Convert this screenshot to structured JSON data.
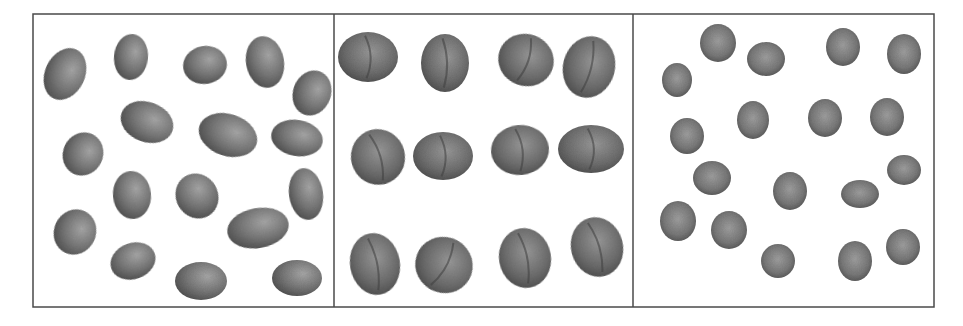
{
  "figure": {
    "frame": {
      "x": 33,
      "y": 14,
      "width": 901,
      "height": 293,
      "stroke": "#4a4a4a"
    },
    "dividers": [
      334,
      633
    ],
    "colors": {
      "seed_dark": "#4f4f4f",
      "seed_mid": "#7a7a7a",
      "seed_light": "#a8a8a8",
      "background": "#ffffff"
    },
    "panels": [
      {
        "name": "elongated-seeds-panel",
        "kind": "elongated-seed",
        "count": 17,
        "items": [
          [
            65,
            74,
            20,
            27,
            25
          ],
          [
            131,
            57,
            17,
            23,
            5
          ],
          [
            205,
            65,
            22,
            19,
            -10
          ],
          [
            265,
            62,
            19,
            26,
            -10
          ],
          [
            312,
            93,
            19,
            23,
            20
          ],
          [
            147,
            122,
            27,
            20,
            20
          ],
          [
            228,
            135,
            30,
            21,
            18
          ],
          [
            297,
            138,
            26,
            18,
            10
          ],
          [
            83,
            154,
            20,
            22,
            25
          ],
          [
            132,
            195,
            19,
            24,
            -5
          ],
          [
            197,
            196,
            21,
            23,
            -30
          ],
          [
            306,
            194,
            17,
            26,
            -8
          ],
          [
            75,
            232,
            21,
            23,
            25
          ],
          [
            258,
            228,
            31,
            20,
            -10
          ],
          [
            133,
            261,
            23,
            18,
            -20
          ],
          [
            201,
            281,
            26,
            19,
            0
          ],
          [
            297,
            278,
            25,
            18,
            0
          ]
        ]
      },
      {
        "name": "walnut-panel",
        "kind": "walnut",
        "count": 12,
        "items": [
          [
            368,
            57,
            30,
            25,
            0
          ],
          [
            445,
            63,
            24,
            29,
            0
          ],
          [
            526,
            60,
            28,
            26,
            20
          ],
          [
            589,
            67,
            26,
            31,
            15
          ],
          [
            378,
            157,
            27,
            28,
            -15
          ],
          [
            443,
            156,
            30,
            24,
            0
          ],
          [
            520,
            150,
            29,
            25,
            -5
          ],
          [
            591,
            149,
            33,
            24,
            0
          ],
          [
            375,
            264,
            25,
            31,
            -10
          ],
          [
            444,
            265,
            29,
            28,
            30
          ],
          [
            525,
            258,
            26,
            30,
            -10
          ],
          [
            597,
            247,
            26,
            30,
            -15
          ]
        ]
      },
      {
        "name": "pea-panel",
        "kind": "pea",
        "count": 18,
        "items": [
          [
            718,
            43,
            18,
            19,
            0
          ],
          [
            766,
            59,
            19,
            17,
            0
          ],
          [
            843,
            47,
            17,
            19,
            0
          ],
          [
            904,
            54,
            17,
            20,
            0
          ],
          [
            677,
            80,
            15,
            17,
            0
          ],
          [
            753,
            120,
            16,
            19,
            0
          ],
          [
            825,
            118,
            17,
            19,
            0
          ],
          [
            887,
            117,
            17,
            19,
            0
          ],
          [
            687,
            136,
            17,
            18,
            0
          ],
          [
            712,
            178,
            19,
            17,
            0
          ],
          [
            790,
            191,
            17,
            19,
            0
          ],
          [
            860,
            194,
            19,
            14,
            0
          ],
          [
            904,
            170,
            17,
            15,
            0
          ],
          [
            678,
            221,
            18,
            20,
            0
          ],
          [
            729,
            230,
            18,
            19,
            0
          ],
          [
            778,
            261,
            17,
            17,
            0
          ],
          [
            855,
            261,
            17,
            20,
            0
          ],
          [
            903,
            247,
            17,
            18,
            0
          ]
        ]
      }
    ]
  }
}
